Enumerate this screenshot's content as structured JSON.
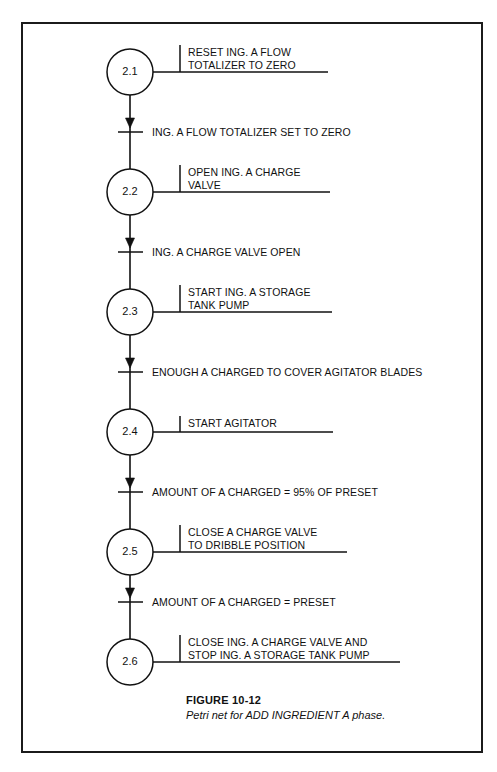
{
  "figure": {
    "caption_number": "FIGURE 10-12",
    "caption_text": "Petri net for ADD INGREDIENT A phase."
  },
  "chart_data": {
    "type": "diagram",
    "diagram_type": "petri-net",
    "title": "FIGURE 10-12",
    "subtitle": "Petri net for ADD INGREDIENT A phase.",
    "orientation": "vertical",
    "places": [
      {
        "id": "2.1",
        "label": "2.1",
        "cx": 130,
        "cy": 72,
        "r": 23
      },
      {
        "id": "2.2",
        "label": "2.2",
        "cx": 130,
        "cy": 192,
        "r": 23
      },
      {
        "id": "2.3",
        "label": "2.3",
        "cx": 130,
        "cy": 312,
        "r": 23
      },
      {
        "id": "2.4",
        "label": "2.4",
        "cx": 130,
        "cy": 432,
        "r": 23
      },
      {
        "id": "2.5",
        "label": "2.5",
        "cx": 130,
        "cy": 552,
        "r": 23
      },
      {
        "id": "2.6",
        "label": "2.6",
        "cx": 130,
        "cy": 662,
        "r": 23
      }
    ],
    "actions": [
      {
        "place": "2.1",
        "lines": [
          "RESET ING. A FLOW",
          "TOTALIZER TO ZERO"
        ],
        "line_end_x": 328
      },
      {
        "place": "2.2",
        "lines": [
          "OPEN ING. A CHARGE",
          "VALVE"
        ],
        "line_end_x": 330
      },
      {
        "place": "2.3",
        "lines": [
          "START ING. A STORAGE",
          "TANK PUMP"
        ],
        "line_end_x": 332
      },
      {
        "place": "2.4",
        "lines": [
          "START AGITATOR"
        ],
        "line_end_x": 333
      },
      {
        "place": "2.5",
        "lines": [
          "CLOSE A CHARGE VALVE",
          "TO DRIBBLE POSITION"
        ],
        "line_end_x": 347
      },
      {
        "place": "2.6",
        "lines": [
          "CLOSE ING. A CHARGE VALVE AND",
          "STOP ING. A STORAGE TANK PUMP"
        ],
        "line_end_x": 400
      }
    ],
    "transitions": [
      {
        "from": "2.1",
        "to": "2.2",
        "label": "ING. A FLOW TOTALIZER SET TO ZERO",
        "y": 132
      },
      {
        "from": "2.2",
        "to": "2.3",
        "label": "ING. A CHARGE VALVE OPEN",
        "y": 252
      },
      {
        "from": "2.3",
        "to": "2.4",
        "label": "ENOUGH A CHARGED TO COVER AGITATOR BLADES",
        "y": 372
      },
      {
        "from": "2.4",
        "to": "2.5",
        "label": "AMOUNT OF A CHARGED = 95% OF PRESET",
        "y": 492
      },
      {
        "from": "2.5",
        "to": "2.6",
        "label": "AMOUNT OF A CHARGED = PRESET",
        "y": 602
      }
    ],
    "colors": {
      "ink": "#111111",
      "frame": "#1b1b1b",
      "background": "#ffffff"
    }
  }
}
